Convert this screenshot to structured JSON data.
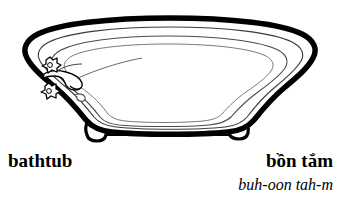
{
  "entry": {
    "english_label": "bathtub",
    "vietnamese_label": "bồn tắm",
    "pronunciation": "buh-oon tah-m"
  },
  "illustration": {
    "name": "clawfoot-bathtub-line-drawing",
    "subject": "bathtub",
    "style": "black-and-white line art",
    "outline_color": "#000000",
    "fill_color": "#ffffff",
    "inner_line_color": "#444444",
    "parts": [
      "tub-rim",
      "tub-basin",
      "faucet-spout",
      "hot-tap-handle",
      "cold-tap-handle",
      "drain",
      "left-clawfoot",
      "right-clawfoot",
      "foot-connecting-bar"
    ]
  },
  "page": {
    "background_color": "#ffffff",
    "width": 341,
    "height": 198
  }
}
